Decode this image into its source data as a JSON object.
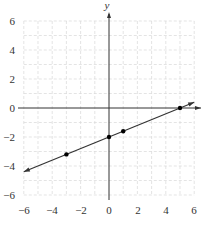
{
  "chart_data": {
    "type": "line",
    "title": "",
    "xlabel": "",
    "ylabel": "y",
    "xlim": [
      -6,
      6
    ],
    "ylim": [
      -6,
      6
    ],
    "grid": true,
    "grid_style": "dashed light gray, every 1 unit",
    "x_ticks": [
      -6,
      -4,
      -2,
      0,
      2,
      4,
      6
    ],
    "y_ticks": [
      -6,
      -4,
      -2,
      0,
      2,
      4,
      6
    ],
    "x_tick_labels": [
      "−6",
      "−4",
      "−2",
      "0",
      "2",
      "4",
      "6"
    ],
    "y_tick_labels": [
      "−6",
      "−4",
      "−2",
      "0",
      "2",
      "4",
      "6"
    ],
    "series": [
      {
        "name": "y = 0.4x − 2",
        "type": "line",
        "slope": 0.4,
        "intercept": -2,
        "endpoints_with_arrows": [
          [
            -6,
            -4.4
          ],
          [
            6,
            0.4
          ]
        ],
        "color": "#333333"
      },
      {
        "name": "marked points",
        "type": "scatter",
        "points": [
          [
            -3,
            -3.2
          ],
          [
            0,
            -2
          ],
          [
            1,
            -1.6
          ],
          [
            5,
            0
          ]
        ],
        "color": "#000000"
      }
    ],
    "legend": null
  },
  "labels": {
    "y_axis": "y",
    "x_ticks": [
      "−6",
      "−4",
      "−2",
      "0",
      "2",
      "4",
      "6"
    ],
    "y_ticks": [
      "6",
      "4",
      "2",
      "0",
      "−2",
      "−4",
      "−6"
    ]
  },
  "colors": {
    "axis": "#333333",
    "grid": "#d9d9d9",
    "line": "#333333",
    "point": "#000000"
  }
}
